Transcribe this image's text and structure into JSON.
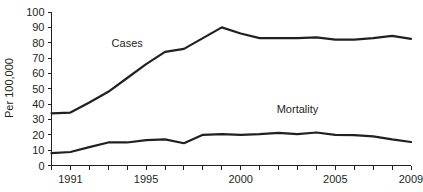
{
  "chart_data": {
    "type": "line",
    "title": "",
    "xlabel": "",
    "ylabel": "Per 100,000",
    "xlim": [
      1990,
      2009
    ],
    "ylim": [
      0,
      100
    ],
    "grid": false,
    "legend_position": "inline-annotations",
    "x": [
      1990,
      1991,
      1992,
      1993,
      1994,
      1995,
      1996,
      1997,
      1998,
      1999,
      2000,
      2001,
      2002,
      2003,
      2004,
      2005,
      2006,
      2007,
      2008,
      2009
    ],
    "series": [
      {
        "name": "Cases",
        "values": [
          34,
          34.5,
          41,
          48,
          57,
          66,
          74,
          76,
          83,
          90,
          86,
          83,
          83,
          83,
          83.5,
          82,
          82,
          83,
          84.5,
          82.5
        ]
      },
      {
        "name": "Mortality",
        "values": [
          8,
          8.8,
          12,
          15,
          15,
          16.5,
          17,
          14.5,
          20,
          20.5,
          20,
          20.5,
          21.3,
          20.5,
          21.5,
          20,
          19.8,
          19,
          17,
          15.3
        ]
      }
    ],
    "annotations": [
      {
        "text": "Cases",
        "x": 1994,
        "y": 77
      },
      {
        "text": "Mortality",
        "x": 2003,
        "y": 34
      }
    ],
    "y_ticks": [
      0,
      10,
      20,
      30,
      40,
      50,
      60,
      70,
      80,
      90,
      100
    ],
    "y_tick_labels": [
      "0",
      "10",
      "20",
      "30",
      "40",
      "50",
      "60",
      "70",
      "80",
      "90",
      "100"
    ],
    "x_ticks": [
      1990,
      1991,
      1992,
      1993,
      1994,
      1995,
      1996,
      1997,
      1998,
      1999,
      2000,
      2001,
      2002,
      2003,
      2004,
      2005,
      2006,
      2007,
      2008,
      2009
    ],
    "x_tick_labels_shown": [
      {
        "value": 1991,
        "label": "1991"
      },
      {
        "value": 1995,
        "label": "1995"
      },
      {
        "value": 2000,
        "label": "2000"
      },
      {
        "value": 2005,
        "label": "2005"
      },
      {
        "value": 2009,
        "label": "2009"
      }
    ],
    "colors": {
      "line": "#231f20",
      "axis": "#231f20",
      "background": "#ffffff",
      "text": "#231f20"
    }
  }
}
